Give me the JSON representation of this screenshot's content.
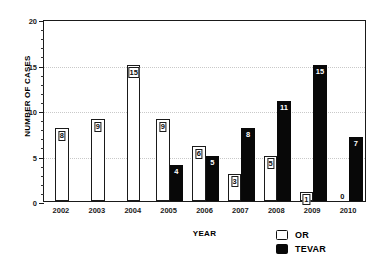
{
  "chart_data": {
    "type": "bar",
    "title": "",
    "xlabel": "YEAR",
    "ylabel": "NUMBER OF CASES",
    "categories": [
      "2002",
      "2003",
      "2004",
      "2005",
      "2006",
      "2007",
      "2008",
      "2009",
      "2010"
    ],
    "series": [
      {
        "name": "OR",
        "color": "#ffffff",
        "values": [
          8,
          9,
          15,
          9,
          6,
          3,
          5,
          1,
          0
        ]
      },
      {
        "name": "TEVAR",
        "color": "#080808",
        "values": [
          0,
          0,
          0,
          4,
          5,
          8,
          11,
          15,
          7
        ]
      }
    ],
    "ylim": [
      0,
      20
    ],
    "yticks": [
      0,
      5,
      10,
      15,
      20
    ],
    "ytick_labels": [
      "0",
      "5",
      "10",
      "15",
      "20"
    ],
    "yminor_interval": 1,
    "grid": "horizontal-dotted",
    "legend_position": "bottom-right",
    "bar_labels_shown": true
  },
  "legend": {
    "items": [
      {
        "label": "OR",
        "swatch": "hollow-square"
      },
      {
        "label": "TEVAR",
        "swatch": "filled-square"
      }
    ]
  }
}
